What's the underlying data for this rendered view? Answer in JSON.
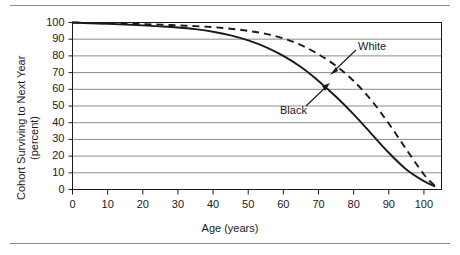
{
  "chart_data": {
    "type": "line",
    "title": "",
    "xlabel": "Age (years)",
    "ylabel": "Cohort Surviving to Next Year (percent)",
    "ylabel_line1": "Cohort Surviving to Next Year",
    "ylabel_line2": "(percent)",
    "xlim": [
      0,
      105
    ],
    "ylim": [
      0,
      100
    ],
    "xticks": [
      0,
      10,
      20,
      30,
      40,
      50,
      60,
      70,
      80,
      90,
      100
    ],
    "yticks": [
      0,
      10,
      20,
      30,
      40,
      50,
      60,
      70,
      80,
      90,
      100
    ],
    "xtick_labels": [
      "0",
      "10",
      "20",
      "30",
      "40",
      "50",
      "60",
      "70",
      "80",
      "90",
      "100"
    ],
    "ytick_labels": [
      "0",
      "10",
      "20",
      "30",
      "40",
      "50",
      "60",
      "70",
      "80",
      "90",
      "100"
    ],
    "grid": true,
    "grid_axis": "y",
    "legend": "annotations",
    "x": [
      0,
      5,
      10,
      15,
      20,
      25,
      30,
      35,
      40,
      45,
      50,
      55,
      60,
      65,
      70,
      75,
      80,
      85,
      90,
      95,
      100,
      103
    ],
    "series": [
      {
        "name": "White",
        "style": "dashed",
        "color": "#1a1a1a",
        "values": [
          100,
          99.7,
          99.5,
          99.3,
          99.0,
          98.7,
          98.3,
          97.8,
          97.2,
          96.3,
          95.0,
          93.2,
          90.5,
          86.5,
          81.0,
          74.0,
          65.0,
          53.5,
          39.5,
          24.0,
          9.0,
          2.5
        ]
      },
      {
        "name": "Black",
        "style": "solid",
        "color": "#1a1a1a",
        "values": [
          100,
          99.5,
          99.2,
          98.8,
          98.3,
          97.7,
          97.0,
          96.0,
          94.5,
          92.3,
          89.3,
          85.3,
          80.0,
          73.3,
          65.0,
          55.5,
          45.0,
          33.5,
          22.0,
          12.0,
          5.0,
          2.0
        ]
      }
    ],
    "annotations": [
      {
        "text": "White",
        "points_to": "white-dashed-curve"
      },
      {
        "text": "Black",
        "points_to": "black-solid-curve"
      }
    ]
  },
  "colors": {
    "line": "#1a1a1a",
    "grid": "#8c8c8c",
    "axis": "#1a1a1a",
    "rule": "#8c8c8c",
    "background": "#ffffff"
  }
}
